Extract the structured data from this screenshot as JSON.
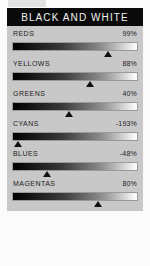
{
  "window": {
    "background_color": "#fbfbfb",
    "panel_background_color": "#c8c8c8"
  },
  "panel": {
    "title": "BLACK AND WHITE",
    "title_bar_color": "#0a0a0a",
    "title_text_color": "#f2f2f2"
  },
  "sliders": [
    {
      "label": "REDS",
      "value": "99%",
      "percent": 99,
      "marker_pos": 76
    },
    {
      "label": "YELLOWS",
      "value": "88%",
      "percent": 88,
      "marker_pos": 62
    },
    {
      "label": "GREENS",
      "value": "40%",
      "percent": 40,
      "marker_pos": 45
    },
    {
      "label": "CYANS",
      "value": "-193%",
      "percent": -193,
      "marker_pos": 5
    },
    {
      "label": "BLUES",
      "value": "-48%",
      "percent": -48,
      "marker_pos": 28
    },
    {
      "label": "MAGENTAS",
      "value": "80%",
      "percent": 80,
      "marker_pos": 68
    }
  ]
}
